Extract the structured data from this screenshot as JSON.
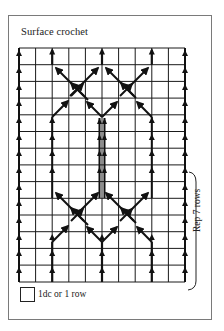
{
  "diagram": {
    "title": "Surface crochet",
    "legend": {
      "symbol": "grid-square",
      "label": "1dc or 1 row"
    },
    "repeat_bracket": {
      "label": "Rep 7 rows"
    },
    "grid": {
      "columns": 10,
      "rows": 14,
      "line_color": "#1a1a1a",
      "ink_color": "#111111"
    },
    "frame_color": "#7a7a7a"
  }
}
